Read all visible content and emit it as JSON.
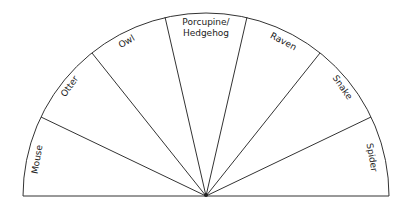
{
  "diagram": {
    "type": "semicircle-wheel",
    "sectors": [
      {
        "label": "Mouse"
      },
      {
        "label": "Otter"
      },
      {
        "label": "Owl"
      },
      {
        "label_line1": "Porcupine/",
        "label_line2": "Hedgehog"
      },
      {
        "label": "Raven"
      },
      {
        "label": "Snake"
      },
      {
        "label": "Spider"
      }
    ],
    "colors": {
      "stroke": "#333333",
      "background": "#ffffff",
      "text": "#222222"
    }
  }
}
